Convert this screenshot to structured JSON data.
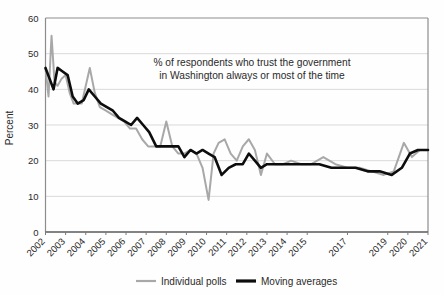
{
  "chart_data": {
    "type": "line",
    "title": "",
    "annotation": {
      "line1": "% of respondents who trust the government",
      "line2": "in Washington always or most of the time"
    },
    "xlabel": "",
    "ylabel": "Percent",
    "ylim": [
      0,
      60
    ],
    "yticks": [
      0,
      10,
      20,
      30,
      40,
      50,
      60
    ],
    "ytick_labels": [
      "0",
      "10",
      "20",
      "30",
      "40",
      "50",
      "60"
    ],
    "xlim": [
      2002,
      2021
    ],
    "xtick_labels": [
      "2002",
      "2003",
      "2004",
      "2005",
      "2006",
      "2007",
      "2008",
      "2009",
      "2010",
      "2011",
      "2012",
      "2013",
      "2014",
      "2015",
      "2017",
      "2019",
      "2020",
      "2021"
    ],
    "xtick_values": [
      2002,
      2003,
      2004,
      2005,
      2006,
      2007,
      2008,
      2009,
      2010,
      2011,
      2012,
      2013,
      2014,
      2015,
      2017,
      2019,
      2020,
      2021
    ],
    "grid": "horizontal",
    "legend_position": "bottom-center",
    "colors": {
      "individual_polls": "#a8a8a8",
      "moving_averages": "#0d0d0d",
      "grid": "#d9d9d9",
      "axis": "#808080",
      "text": "#2a2a2a",
      "background": "#fefefe"
    },
    "series": [
      {
        "name": "Individual polls",
        "color": "#a8a8a8",
        "x": [
          2002.0,
          2002.15,
          2002.3,
          2002.45,
          2002.6,
          2002.8,
          2003.0,
          2003.2,
          2003.4,
          2003.6,
          2003.8,
          2004.0,
          2004.2,
          2004.45,
          2004.7,
          2005.0,
          2005.3,
          2005.6,
          2005.9,
          2006.2,
          2006.5,
          2006.8,
          2007.1,
          2007.4,
          2007.7,
          2008.0,
          2008.3,
          2008.6,
          2008.9,
          2009.2,
          2009.5,
          2009.8,
          2010.1,
          2010.35,
          2010.6,
          2010.9,
          2011.2,
          2011.5,
          2011.8,
          2012.1,
          2012.4,
          2012.7,
          2013.0,
          2013.4,
          2013.8,
          2014.2,
          2014.7,
          2015.2,
          2015.8,
          2016.4,
          2017.0,
          2017.6,
          2018.2,
          2018.8,
          2019.3,
          2019.8,
          2020.2,
          2020.6,
          2021.0
        ],
        "y": [
          46,
          38,
          55,
          42,
          41,
          43,
          44,
          39,
          36,
          36,
          36,
          41,
          46,
          39,
          35,
          34,
          33,
          32,
          31,
          29,
          29,
          26,
          24,
          24,
          24,
          31,
          24,
          22,
          22,
          23,
          22,
          18,
          9,
          22,
          25,
          26,
          22,
          20,
          24,
          26,
          23,
          16,
          22,
          19,
          19,
          20,
          19,
          19,
          21,
          19,
          18,
          18,
          17,
          16,
          17,
          25,
          21,
          23,
          23
        ]
      },
      {
        "name": "Moving averages",
        "color": "#0d0d0d",
        "x": [
          2002.0,
          2002.2,
          2002.4,
          2002.6,
          2002.85,
          2003.1,
          2003.35,
          2003.6,
          2003.9,
          2004.15,
          2004.45,
          2004.75,
          2005.05,
          2005.35,
          2005.65,
          2005.95,
          2006.25,
          2006.55,
          2006.85,
          2007.15,
          2007.5,
          2007.9,
          2008.25,
          2008.6,
          2008.9,
          2009.2,
          2009.5,
          2009.8,
          2010.1,
          2010.4,
          2010.75,
          2011.1,
          2011.45,
          2011.8,
          2012.1,
          2012.4,
          2012.7,
          2013.0,
          2013.5,
          2014.0,
          2014.5,
          2015.0,
          2015.6,
          2016.2,
          2016.8,
          2017.4,
          2018.0,
          2018.6,
          2019.2,
          2019.7,
          2020.1,
          2020.5,
          2021.0
        ],
        "y": [
          46,
          43,
          40,
          46,
          45,
          44,
          38,
          36,
          37,
          40,
          38,
          36,
          35,
          34,
          32,
          31,
          30,
          32,
          30,
          28,
          24,
          24,
          24,
          24,
          21,
          23,
          22,
          23,
          22,
          21,
          16,
          18,
          19,
          19,
          22,
          20,
          18,
          19,
          19,
          19,
          19,
          19,
          19,
          18,
          18,
          18,
          17,
          17,
          16,
          18,
          22,
          23,
          23
        ]
      }
    ]
  },
  "legend": {
    "items": [
      {
        "label": "Individual polls",
        "color": "#a8a8a8",
        "weight": "thin"
      },
      {
        "label": "Moving averages",
        "color": "#0d0d0d",
        "weight": "thick"
      }
    ]
  }
}
